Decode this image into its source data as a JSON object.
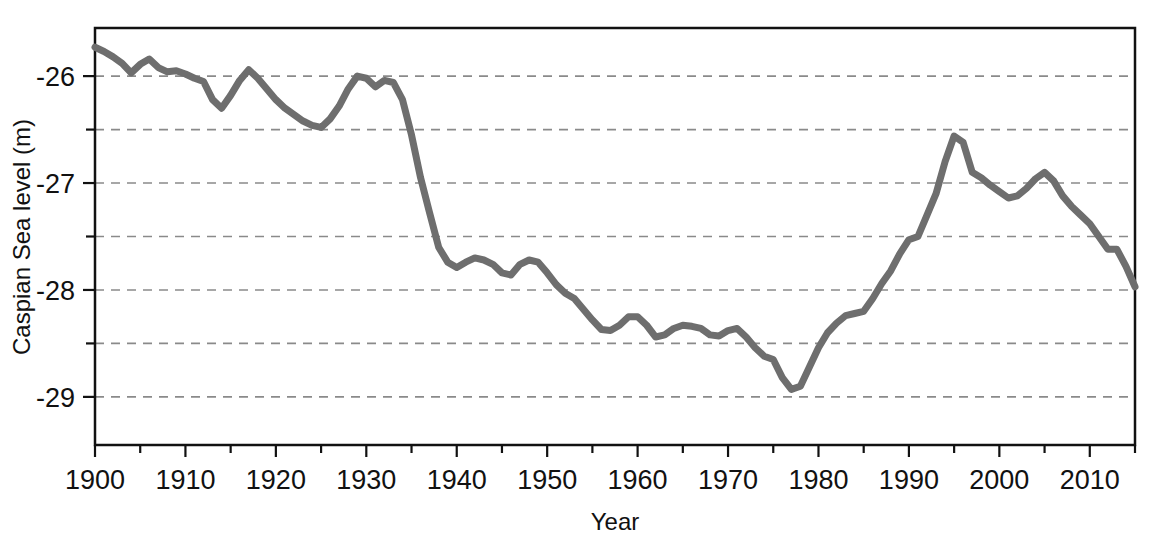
{
  "chart_data": {
    "type": "line",
    "title": "",
    "xlabel": "Year",
    "ylabel": "Caspian Sea level (m)",
    "xlim": [
      1900,
      2015
    ],
    "ylim": [
      -29.45,
      -25.55
    ],
    "xticks_major": [
      1900,
      1910,
      1920,
      1930,
      1940,
      1950,
      1960,
      1970,
      1980,
      1990,
      2000,
      2010
    ],
    "xticks_minor": [
      1905,
      1915,
      1925,
      1935,
      1945,
      1955,
      1965,
      1975,
      1985,
      1995,
      2005,
      2015
    ],
    "yticks_major": [
      -26,
      -27,
      -28,
      -29
    ],
    "yticks_minor": [
      -26.5,
      -27.5,
      -28.5
    ],
    "gridlines": [
      -26,
      -26.5,
      -27,
      -27.5,
      -28,
      -28.5,
      -29
    ],
    "grid": "horizontal-dashed",
    "legend": "none",
    "line_color": "#6e6e6e",
    "line_width_px": 7,
    "axis_color": "#111111",
    "grid_color": "#8a8a8a",
    "background": "#ffffff",
    "series": [
      {
        "name": "Caspian Sea level",
        "x": [
          1900,
          1901,
          1902,
          1903,
          1904,
          1905,
          1906,
          1907,
          1908,
          1909,
          1910,
          1911,
          1912,
          1913,
          1914,
          1915,
          1916,
          1917,
          1918,
          1919,
          1920,
          1921,
          1922,
          1923,
          1924,
          1925,
          1926,
          1927,
          1928,
          1929,
          1930,
          1931,
          1932,
          1933,
          1934,
          1935,
          1936,
          1937,
          1938,
          1939,
          1940,
          1941,
          1942,
          1943,
          1944,
          1945,
          1946,
          1947,
          1948,
          1949,
          1950,
          1951,
          1952,
          1953,
          1954,
          1955,
          1956,
          1957,
          1958,
          1959,
          1960,
          1961,
          1962,
          1963,
          1964,
          1965,
          1966,
          1967,
          1968,
          1969,
          1970,
          1971,
          1972,
          1973,
          1974,
          1975,
          1976,
          1977,
          1978,
          1979,
          1980,
          1981,
          1982,
          1983,
          1984,
          1985,
          1986,
          1987,
          1988,
          1989,
          1990,
          1991,
          1992,
          1993,
          1994,
          1995,
          1996,
          1997,
          1998,
          1999,
          2000,
          2001,
          2002,
          2003,
          2004,
          2005,
          2006,
          2007,
          2008,
          2009,
          2010,
          2011,
          2012,
          2013,
          2014,
          2015
        ],
        "y": [
          -25.73,
          -25.77,
          -25.82,
          -25.88,
          -25.97,
          -25.89,
          -25.84,
          -25.92,
          -25.96,
          -25.95,
          -25.98,
          -26.02,
          -26.05,
          -26.22,
          -26.3,
          -26.18,
          -26.04,
          -25.94,
          -26.02,
          -26.12,
          -26.22,
          -26.3,
          -26.36,
          -26.42,
          -26.46,
          -26.48,
          -26.4,
          -26.28,
          -26.12,
          -26.0,
          -26.02,
          -26.1,
          -26.04,
          -26.06,
          -26.22,
          -26.55,
          -26.95,
          -27.28,
          -27.6,
          -27.74,
          -27.79,
          -27.74,
          -27.7,
          -27.72,
          -27.76,
          -27.84,
          -27.86,
          -27.76,
          -27.72,
          -27.74,
          -27.84,
          -27.95,
          -28.03,
          -28.08,
          -28.18,
          -28.28,
          -28.37,
          -28.38,
          -28.33,
          -28.25,
          -28.25,
          -28.33,
          -28.44,
          -28.42,
          -28.36,
          -28.33,
          -28.34,
          -28.36,
          -28.42,
          -28.43,
          -28.38,
          -28.36,
          -28.44,
          -28.54,
          -28.62,
          -28.65,
          -28.82,
          -28.93,
          -28.9,
          -28.72,
          -28.54,
          -28.4,
          -28.31,
          -28.24,
          -28.22,
          -28.2,
          -28.08,
          -27.94,
          -27.82,
          -27.66,
          -27.53,
          -27.5,
          -27.3,
          -27.1,
          -26.8,
          -26.56,
          -26.62,
          -26.9,
          -26.95,
          -27.02,
          -27.08,
          -27.14,
          -27.12,
          -27.05,
          -26.96,
          -26.9,
          -26.98,
          -27.12,
          -27.22,
          -27.3,
          -27.38,
          -27.5,
          -27.62,
          -27.62,
          -27.78,
          -27.97
        ]
      }
    ]
  },
  "axis": {
    "ylabel": "Caspian Sea level (m)",
    "xlabel": "Year",
    "ytick_labels": [
      "-26",
      "-27",
      "-28",
      "-29"
    ],
    "xtick_labels": [
      "1900",
      "1910",
      "1920",
      "1930",
      "1940",
      "1950",
      "1960",
      "1970",
      "1980",
      "1990",
      "2000",
      "2010"
    ]
  }
}
